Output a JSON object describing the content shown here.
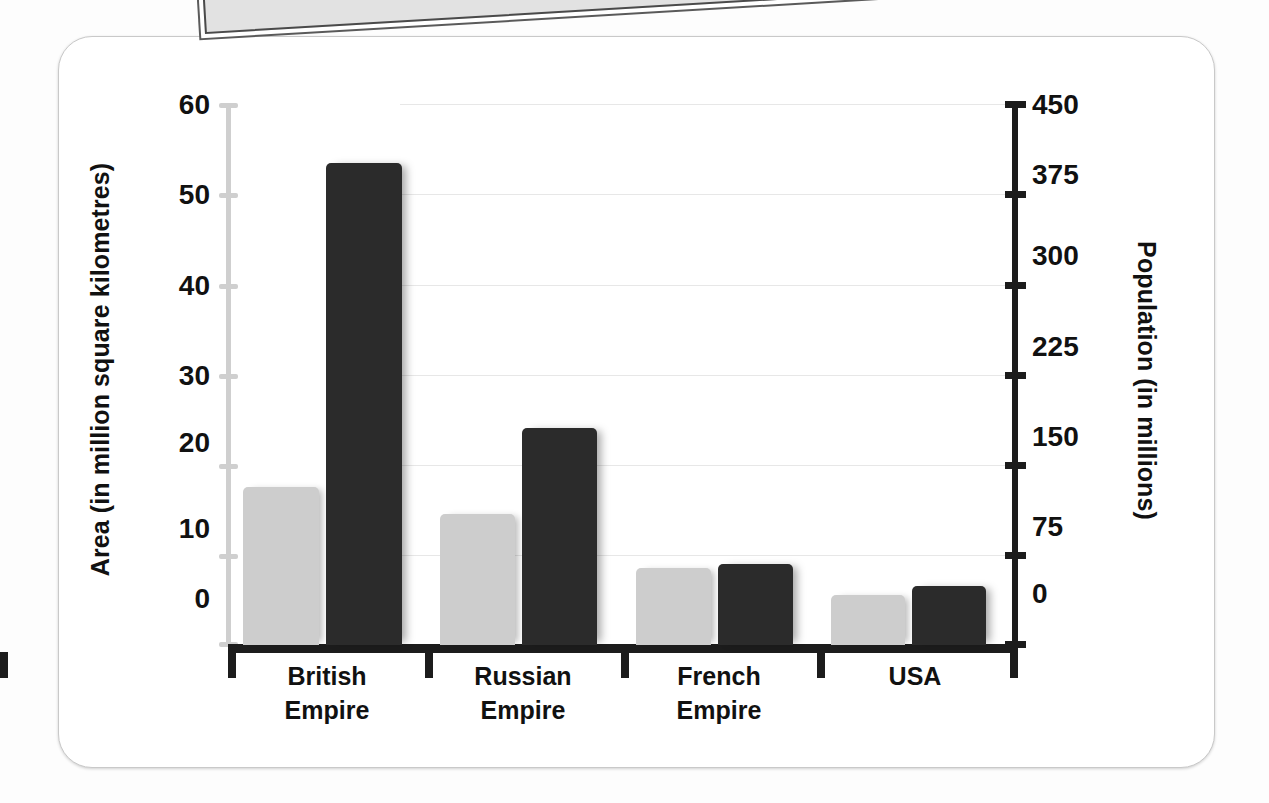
{
  "chart_data": {
    "type": "bar",
    "title": "",
    "categories": [
      "British Empire",
      "Russian Empire",
      "French Empire",
      "USA"
    ],
    "category_lines": [
      [
        "British",
        "Empire"
      ],
      [
        "Russian",
        "Empire"
      ],
      [
        "French",
        "Empire"
      ],
      [
        "USA",
        ""
      ]
    ],
    "series": [
      {
        "name": "Area",
        "axis": "left",
        "color": "#cdcdcd",
        "values": [
          17.5,
          14.5,
          8.5,
          5.5
        ]
      },
      {
        "name": "Population",
        "axis": "right",
        "color": "#2b2b2b",
        "values": [
          400,
          180,
          67,
          49
        ]
      }
    ],
    "left_axis": {
      "label": "Area (in million square kilometres)",
      "ticks": [
        0,
        10,
        20,
        30,
        40,
        50,
        60
      ],
      "min": 0,
      "max": 60
    },
    "right_axis": {
      "label": "Population (in millions)",
      "ticks": [
        0,
        75,
        150,
        225,
        300,
        375,
        450
      ],
      "min": 0,
      "max": 450
    },
    "xlabel": "",
    "grid": true,
    "legend": "none"
  },
  "ticks_left": [
    "60",
    "50",
    "40",
    "30",
    "20",
    "10",
    "0"
  ],
  "ticks_right": [
    "450",
    "375",
    "300",
    "225",
    "150",
    "75",
    "0"
  ],
  "labels": {
    "left_title": "Area (in million square kilometres)",
    "right_title": "Population (in millions)",
    "cat0_l1": "British",
    "cat0_l2": "Empire",
    "cat1_l1": "Russian",
    "cat1_l2": "Empire",
    "cat2_l1": "French",
    "cat2_l2": "Empire",
    "cat3_l1": "USA",
    "cat3_l2": ""
  }
}
